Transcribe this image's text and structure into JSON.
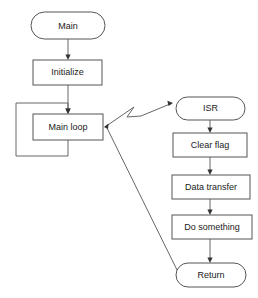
{
  "diagram": {
    "background_color": "#ffffff",
    "node_fill": "#ffffff",
    "node_stroke": "#555555",
    "edge_color": "#666666",
    "text_color": "#1a1a1a",
    "nodes": {
      "main": {
        "label": "Main",
        "shape": "terminator",
        "x": 31,
        "y": 12,
        "w": 74,
        "h": 27
      },
      "initialize": {
        "label": "Initialize",
        "shape": "process",
        "x": 33,
        "y": 60,
        "w": 69,
        "h": 25
      },
      "main_loop": {
        "label": "Main loop",
        "shape": "process",
        "x": 33,
        "y": 114,
        "w": 70,
        "h": 26
      },
      "isr": {
        "label": "ISR",
        "shape": "terminator",
        "x": 176,
        "y": 97,
        "w": 69,
        "h": 23
      },
      "clear_flag": {
        "label": "Clear flag",
        "shape": "process",
        "x": 173,
        "y": 133,
        "w": 74,
        "h": 24
      },
      "data_transfer": {
        "label": "Data transfer",
        "shape": "process",
        "x": 172,
        "y": 175,
        "w": 78,
        "h": 24
      },
      "do_something": {
        "label": "Do something",
        "shape": "process",
        "x": 172,
        "y": 215,
        "w": 80,
        "h": 24
      },
      "return": {
        "label": "Return",
        "shape": "terminator",
        "x": 176,
        "y": 263,
        "w": 70,
        "h": 24
      }
    },
    "edges": [
      {
        "name": "main-to-initialize",
        "from": "main",
        "to": "initialize",
        "style": "solid-arrow"
      },
      {
        "name": "initialize-to-main-loop",
        "from": "initialize",
        "to": "main_loop",
        "style": "solid-arrow"
      },
      {
        "name": "main-loop-feedback",
        "from": "main_loop",
        "to": "main_loop",
        "style": "loop-back-arrow"
      },
      {
        "name": "main-loop-to-isr-interrupt",
        "from": "main_loop",
        "to": "isr",
        "style": "lightning-bolt-arrow"
      },
      {
        "name": "isr-to-clear-flag",
        "from": "isr",
        "to": "clear_flag",
        "style": "solid-arrow"
      },
      {
        "name": "clear-flag-to-data-transfer",
        "from": "clear_flag",
        "to": "data_transfer",
        "style": "solid-arrow"
      },
      {
        "name": "data-transfer-to-do-something",
        "from": "data_transfer",
        "to": "do_something",
        "style": "solid-arrow"
      },
      {
        "name": "do-something-to-return",
        "from": "do_something",
        "to": "return",
        "style": "solid-arrow"
      },
      {
        "name": "return-to-main-loop",
        "from": "return",
        "to": "main_loop",
        "style": "diagonal-line"
      }
    ]
  }
}
